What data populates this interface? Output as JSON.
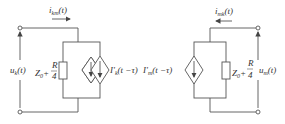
{
  "left_circuit": {
    "current_label": {
      "sym": "i",
      "sub": "km",
      "arg": "(t)"
    },
    "voltage_label": {
      "sym": "u",
      "sub": "k",
      "arg": "(t)"
    },
    "impedance": {
      "z": "Z",
      "zsub": "0",
      "plus": "+",
      "num": "R",
      "den": "4"
    },
    "source_label": {
      "sym": "I'",
      "sub": "k",
      "arg": "(t −τ)"
    }
  },
  "right_circuit": {
    "current_label": {
      "sym": "i",
      "sub": "mk",
      "arg": "(t)"
    },
    "voltage_label": {
      "sym": "u",
      "sub": "m",
      "arg": "(t)"
    },
    "impedance": {
      "z": "Z",
      "zsub": "0",
      "plus": "+",
      "num": "R",
      "den": "4"
    },
    "source_label": {
      "sym": "I'",
      "sub": "m",
      "arg": "(t −τ)"
    }
  },
  "colors": {
    "line": "#555555",
    "text": "#333333"
  }
}
